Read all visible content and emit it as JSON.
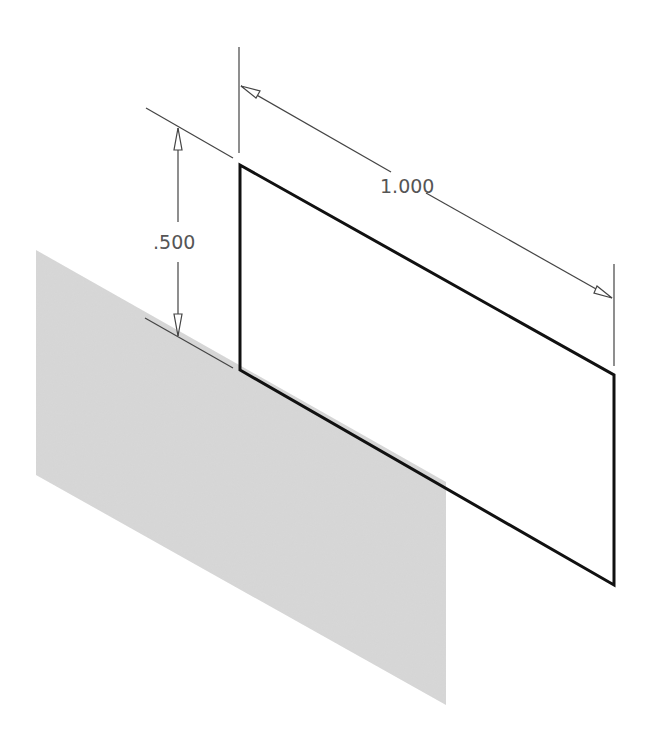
{
  "diagram": {
    "type": "isometric sketch with dimensions",
    "dimensions": {
      "height": {
        "label": ".500"
      },
      "width": {
        "label": "1.000"
      }
    },
    "colors": {
      "plane_fill": "#d6d6d6",
      "sketch_line": "#111111",
      "dimension_line": "#444444",
      "dimension_text": "#555555",
      "background": "#ffffff"
    }
  }
}
